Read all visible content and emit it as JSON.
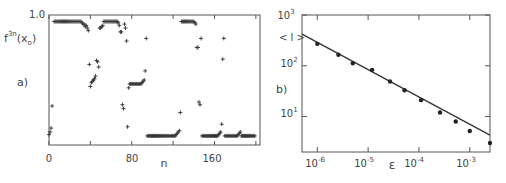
{
  "panels": {
    "a": {
      "label": "a)",
      "ylabel": "f",
      "ylabel_sup": "3n",
      "ylabel_arg": "(x",
      "ylabel_sub": "o",
      "ylabel_close": ")",
      "ytick_top": "1.0",
      "xlabel": "n",
      "xticks": [
        "0",
        "80",
        "160"
      ]
    },
    "b": {
      "label": "b)",
      "ylabel": "< l >",
      "xlabel": "ε",
      "yticks": [
        {
          "base": "10",
          "exp": "3"
        },
        {
          "base": "10",
          "exp": "2"
        },
        {
          "base": "10",
          "exp": "1"
        }
      ],
      "xticks": [
        {
          "base": "10",
          "exp": "-6"
        },
        {
          "base": "10",
          "exp": "-5"
        },
        {
          "base": "10",
          "exp": "-4"
        },
        {
          "base": "10",
          "exp": "-3"
        }
      ]
    }
  },
  "chart_data": [
    {
      "type": "scatter",
      "title": "",
      "panel_label": "a)",
      "xlabel": "n",
      "ylabel": "f^3n(x_o)",
      "xlim": [
        0,
        204
      ],
      "ylim": [
        0,
        1.0
      ],
      "xticks": [
        0,
        40,
        80,
        120,
        160,
        200
      ],
      "xtick_labels": [
        "0",
        "",
        "80",
        "",
        "160",
        ""
      ],
      "ytick_labels": [
        "1.0"
      ],
      "marker": "+",
      "x": [
        0,
        1,
        2,
        3,
        5,
        6,
        7,
        8,
        9,
        10,
        11,
        12,
        13,
        14,
        15,
        16,
        17,
        18,
        19,
        20,
        21,
        22,
        23,
        24,
        25,
        26,
        27,
        28,
        29,
        30,
        31,
        32,
        33,
        34,
        35,
        36,
        37,
        38,
        39,
        40,
        41,
        42,
        43,
        44,
        45,
        46,
        47,
        48,
        49,
        50,
        51,
        52,
        53,
        54,
        55,
        56,
        57,
        58,
        59,
        60,
        61,
        62,
        63,
        64,
        65,
        66,
        67,
        68,
        69,
        70,
        71,
        72,
        73,
        74,
        75,
        76,
        77,
        78,
        79,
        80,
        81,
        82,
        83,
        84,
        85,
        86,
        87,
        88,
        89,
        90,
        91,
        92,
        93,
        94,
        95,
        96,
        97,
        98,
        99,
        100,
        101,
        102,
        103,
        104,
        105,
        106,
        107,
        108,
        109,
        110,
        111,
        112,
        113,
        114,
        115,
        116,
        117,
        118,
        119,
        120,
        121,
        122,
        123,
        124,
        125,
        126,
        127,
        128,
        129,
        130,
        131,
        132,
        133,
        134,
        135,
        136,
        137,
        138,
        139,
        140,
        141,
        142,
        143,
        144,
        145,
        146,
        147,
        148,
        149,
        150,
        151,
        152,
        153,
        154,
        155,
        156,
        157,
        158,
        159,
        160,
        161,
        162,
        163,
        164,
        165,
        166,
        167,
        168,
        169,
        170,
        171,
        172,
        173,
        174,
        175,
        176,
        177,
        178,
        179,
        180,
        181,
        182,
        183,
        184,
        185,
        186,
        187,
        188,
        189,
        190,
        191,
        192,
        193,
        194,
        195,
        196,
        197,
        198,
        199
      ],
      "y": [
        0.08,
        0.1,
        0.13,
        0.3,
        0.95,
        0.95,
        0.95,
        0.95,
        0.95,
        0.95,
        0.95,
        0.95,
        0.95,
        0.95,
        0.95,
        0.95,
        0.95,
        0.95,
        0.95,
        0.95,
        0.95,
        0.95,
        0.95,
        0.95,
        0.95,
        0.95,
        0.95,
        0.95,
        0.95,
        0.95,
        0.95,
        0.94,
        0.93,
        0.93,
        0.91,
        0.92,
        0.9,
        0.88,
        0.62,
        0.45,
        0.48,
        0.49,
        0.5,
        0.51,
        0.53,
        0.65,
        0.64,
        0.6,
        0.9,
        0.9,
        0.91,
        0.92,
        0.95,
        0.95,
        0.95,
        0.95,
        0.95,
        0.95,
        0.95,
        0.95,
        0.95,
        0.95,
        0.95,
        0.95,
        0.95,
        0.95,
        0.94,
        0.92,
        0.87,
        0.87,
        0.31,
        0.28,
        0.93,
        0.9,
        0.8,
        0.14,
        0.44,
        0.47,
        0.47,
        0.47,
        0.47,
        0.47,
        0.47,
        0.47,
        0.47,
        0.47,
        0.47,
        0.47,
        0.47,
        0.48,
        0.49,
        0.5,
        0.57,
        0.82,
        0.07,
        0.07,
        0.07,
        0.07,
        0.07,
        0.07,
        0.07,
        0.07,
        0.07,
        0.07,
        0.07,
        0.07,
        0.07,
        0.07,
        0.07,
        0.07,
        0.07,
        0.07,
        0.07,
        0.07,
        0.07,
        0.07,
        0.07,
        0.07,
        0.07,
        0.07,
        0.07,
        0.07,
        0.08,
        0.09,
        0.1,
        0.11,
        0.25,
        0.95,
        0.95,
        0.95,
        0.95,
        0.95,
        0.95,
        0.95,
        0.95,
        0.95,
        0.95,
        0.95,
        0.95,
        0.95,
        0.94,
        0.93,
        0.75,
        0.75,
        0.33,
        0.31,
        0.82,
        0.07,
        0.07,
        0.07,
        0.07,
        0.07,
        0.07,
        0.07,
        0.07,
        0.07,
        0.07,
        0.07,
        0.07,
        0.07,
        0.07,
        0.07,
        0.07,
        0.08,
        0.09,
        0.1,
        0.16,
        0.66,
        0.82,
        0.07,
        0.07,
        0.07,
        0.07,
        0.07,
        0.07,
        0.07,
        0.07,
        0.07,
        0.07,
        0.07,
        0.07,
        0.07,
        0.08,
        0.09,
        0.1,
        0.07,
        0.07,
        0.07,
        0.07,
        0.07,
        0.07,
        0.07,
        0.07,
        0.07,
        0.07,
        0.07,
        0.07,
        0.07,
        0.07,
        0.07,
        0.07,
        0.07,
        0.07,
        0.07,
        0.07
      ]
    },
    {
      "type": "scatter",
      "title": "",
      "panel_label": "b)",
      "xlabel": "ε",
      "ylabel": "<l>",
      "xscale": "log",
      "yscale": "log",
      "xlim": [
        5e-07,
        0.0025
      ],
      "ylim": [
        2,
        1000
      ],
      "xticks": [
        1e-06,
        1e-05,
        0.0001,
        0.001
      ],
      "yticks": [
        10,
        100,
        1000
      ],
      "grid": false,
      "marker": "filled-circle",
      "x": [
        1e-06,
        2.6e-06,
        5e-06,
        1.2e-05,
        2.7e-05,
        5.2e-05,
        0.00011,
        0.00026,
        0.00053,
        0.001,
        0.0025
      ],
      "y": [
        270,
        165,
        112,
        83,
        49,
        33,
        21,
        12,
        8,
        5.2,
        3.0
      ],
      "fit_line": {
        "x": [
          5e-07,
          0.0025
        ],
        "y": [
          420,
          4.3
        ]
      }
    }
  ]
}
